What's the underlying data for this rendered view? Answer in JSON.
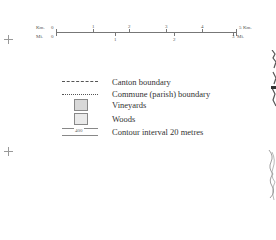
{
  "scale_bar": {
    "km_label": "Km.",
    "mi_label": "Mi.",
    "km_ticks": [
      "0",
      "1",
      "2",
      "3",
      "4",
      "5"
    ],
    "km_end_label": "Km.",
    "mi_ticks": [
      "0",
      "1",
      "2",
      "3"
    ],
    "mi_end_label": "Mi."
  },
  "legend": {
    "items": [
      {
        "symbol": "dashed-line",
        "label": "Canton boundary"
      },
      {
        "symbol": "dotted-line",
        "label": "Commune (parish) boundary"
      },
      {
        "symbol": "grey-box",
        "label": "Vineyards"
      },
      {
        "symbol": "stipple-box",
        "label": "Woods"
      },
      {
        "symbol": "contour-line",
        "label": "Contour interval 20 metres",
        "contour_value": "400"
      }
    ]
  }
}
